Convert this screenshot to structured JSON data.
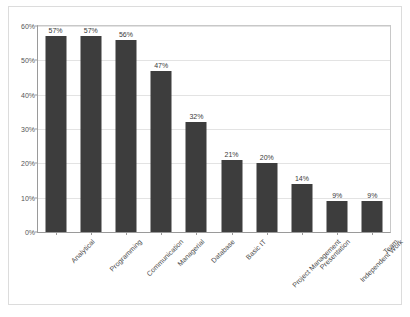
{
  "chart_data": {
    "type": "bar",
    "title": "",
    "subtitle": "",
    "xlabel": "",
    "ylabel": "",
    "ylim": [
      0,
      60
    ],
    "yticks": [
      "0%",
      "10%",
      "20%",
      "30%",
      "40%",
      "50%",
      "60%"
    ],
    "ytick_values": [
      0,
      10,
      20,
      30,
      40,
      50,
      60
    ],
    "grid": true,
    "legend": false,
    "legend_position": "none",
    "bar_color": "#3d3d3d",
    "categories": [
      "Analytical",
      "Programming",
      "Communication",
      "Managerial",
      "Database",
      "Basic IT",
      "Project Management",
      "Presentation",
      "Independent Work",
      "Team"
    ],
    "values": [
      57,
      57,
      56,
      47,
      32,
      21,
      20,
      14,
      9,
      9
    ],
    "data_labels": [
      "57%",
      "57%",
      "56%",
      "47%",
      "32%",
      "21%",
      "20%",
      "14%",
      "9%",
      "9%"
    ]
  }
}
